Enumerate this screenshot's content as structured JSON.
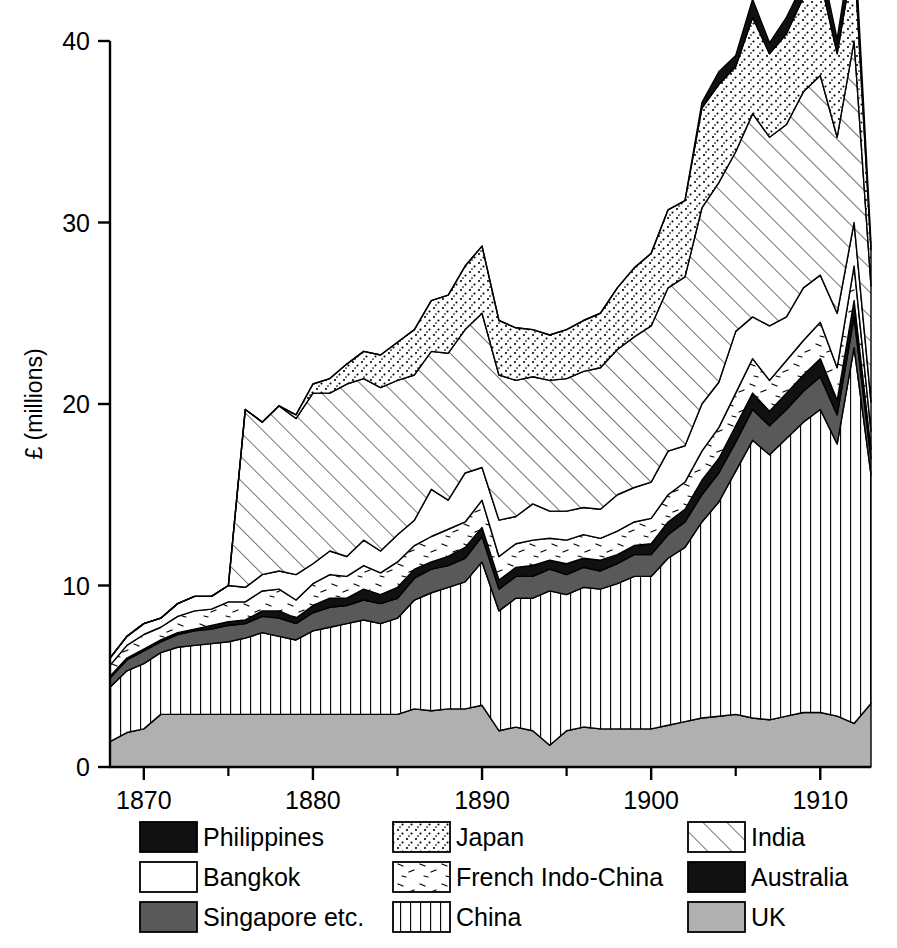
{
  "chart_data": {
    "type": "area",
    "stacked": true,
    "title": "",
    "xlabel": "",
    "ylabel": "£ (millions)",
    "xlim": [
      1868,
      1913
    ],
    "ylim": [
      0,
      40
    ],
    "yticks": [
      0,
      10,
      20,
      30,
      40
    ],
    "xticks": [
      1870,
      1880,
      1890,
      1900,
      1910
    ],
    "xminorticks": [
      1875,
      1885,
      1895,
      1905
    ],
    "grid": false,
    "legend_position": "below",
    "x": [
      1868,
      1869,
      1870,
      1871,
      1872,
      1873,
      1874,
      1875,
      1876,
      1877,
      1878,
      1879,
      1880,
      1881,
      1882,
      1883,
      1884,
      1885,
      1886,
      1887,
      1888,
      1889,
      1890,
      1891,
      1892,
      1893,
      1894,
      1895,
      1896,
      1897,
      1898,
      1899,
      1900,
      1901,
      1902,
      1903,
      1904,
      1905,
      1906,
      1907,
      1908,
      1909,
      1910,
      1911,
      1912,
      1913
    ],
    "stack_order_bottom_to_top": [
      "UK",
      "China",
      "Singapore etc.",
      "Philippines",
      "French Indo-China",
      "Bangkok",
      "India",
      "Japan",
      "Australia"
    ],
    "series": [
      {
        "name": "UK",
        "pattern": "solid-light-gray",
        "color": "#b0b0b0",
        "values": [
          1.4,
          1.9,
          2.1,
          2.9,
          2.9,
          2.9,
          2.9,
          2.9,
          2.9,
          2.9,
          2.9,
          2.9,
          2.9,
          2.9,
          2.9,
          2.9,
          2.9,
          2.9,
          3.2,
          3.1,
          3.2,
          3.2,
          3.4,
          2.0,
          2.2,
          2.0,
          1.2,
          2.0,
          2.2,
          2.1,
          2.1,
          2.1,
          2.1,
          2.3,
          2.5,
          2.7,
          2.8,
          2.9,
          2.7,
          2.6,
          2.8,
          3.0,
          3.0,
          2.8,
          2.4,
          3.5
        ]
      },
      {
        "name": "China",
        "pattern": "vertical-lines",
        "color": "#ffffff",
        "values": [
          3.0,
          3.4,
          3.6,
          3.4,
          3.7,
          3.8,
          3.9,
          4.0,
          4.2,
          4.5,
          4.3,
          4.1,
          4.6,
          4.8,
          5.0,
          5.2,
          5.0,
          5.3,
          6.0,
          6.5,
          6.7,
          7.0,
          7.9,
          6.6,
          7.1,
          7.3,
          8.5,
          7.5,
          7.7,
          7.7,
          8.0,
          8.4,
          8.4,
          9.2,
          9.6,
          10.8,
          11.8,
          13.4,
          15.3,
          14.6,
          15.3,
          16.0,
          16.7,
          15.0,
          20.7,
          12.6
        ]
      },
      {
        "name": "Singapore etc.",
        "pattern": "solid-dark-gray",
        "color": "#595959",
        "values": [
          0.5,
          0.6,
          0.7,
          0.6,
          0.7,
          0.8,
          0.8,
          0.9,
          0.8,
          0.9,
          1.0,
          0.9,
          1.0,
          1.1,
          1.0,
          1.1,
          1.1,
          1.1,
          1.2,
          1.3,
          1.2,
          1.3,
          1.4,
          1.2,
          1.2,
          1.2,
          1.2,
          1.1,
          1.1,
          1.0,
          1.1,
          1.2,
          1.2,
          1.3,
          1.4,
          1.5,
          1.6,
          1.6,
          1.7,
          1.6,
          1.6,
          1.7,
          1.8,
          1.6,
          1.7,
          0.9
        ]
      },
      {
        "name": "Philippines",
        "pattern": "solid-black",
        "color": "#111111",
        "values": [
          0.1,
          0.1,
          0.1,
          0.1,
          0.1,
          0.1,
          0.2,
          0.2,
          0.2,
          0.3,
          0.4,
          0.3,
          0.4,
          0.5,
          0.4,
          0.6,
          0.5,
          0.6,
          0.5,
          0.4,
          0.5,
          0.6,
          0.5,
          0.5,
          0.5,
          0.6,
          0.5,
          0.6,
          0.5,
          0.6,
          0.5,
          0.5,
          0.6,
          0.7,
          0.7,
          0.8,
          0.8,
          0.9,
          0.9,
          0.8,
          0.9,
          0.9,
          1.0,
          0.8,
          0.9,
          0.5
        ]
      },
      {
        "name": "French Indo-China",
        "pattern": "sparse-dashes",
        "color": "#ffffff",
        "values": [
          0.6,
          0.7,
          0.8,
          0.7,
          0.9,
          1.0,
          0.9,
          1.1,
          1.0,
          1.1,
          1.2,
          1.0,
          1.2,
          1.3,
          1.2,
          1.3,
          1.2,
          1.4,
          1.3,
          1.4,
          1.5,
          1.4,
          1.5,
          1.3,
          1.3,
          1.4,
          1.2,
          1.3,
          1.3,
          1.2,
          1.3,
          1.3,
          1.4,
          1.5,
          1.5,
          1.6,
          1.7,
          1.8,
          1.9,
          1.7,
          1.8,
          1.9,
          2.0,
          1.8,
          1.9,
          1.0
        ]
      },
      {
        "name": "Bangkok",
        "pattern": "white",
        "color": "#ffffff",
        "values": [
          0.4,
          0.5,
          0.6,
          0.5,
          0.7,
          0.8,
          0.7,
          0.9,
          0.8,
          0.9,
          1.0,
          1.4,
          1.1,
          1.3,
          1.1,
          1.4,
          1.2,
          1.5,
          1.4,
          2.6,
          1.6,
          2.7,
          1.8,
          2.0,
          1.5,
          2.0,
          1.5,
          1.6,
          1.5,
          1.6,
          2.0,
          1.9,
          2.0,
          2.4,
          2.0,
          2.6,
          2.5,
          3.4,
          2.3,
          3.0,
          2.4,
          2.9,
          2.6,
          3.0,
          2.4,
          1.6
        ]
      },
      {
        "name": "India",
        "pattern": "diagonal-hatch",
        "color": "#ffffff",
        "values": [
          0,
          0,
          0,
          0,
          0,
          0,
          0,
          0,
          9.8,
          8.4,
          9.1,
          8.6,
          9.4,
          8.7,
          9.5,
          8.9,
          9.0,
          8.5,
          8.0,
          7.6,
          8.1,
          7.9,
          8.5,
          8.0,
          7.5,
          7.0,
          7.2,
          7.3,
          7.5,
          7.8,
          8.0,
          8.3,
          8.6,
          9.0,
          9.3,
          10.8,
          11.0,
          9.9,
          11.2,
          10.4,
          10.6,
          10.8,
          11.0,
          9.7,
          10.0,
          6.4
        ]
      },
      {
        "name": "Japan",
        "pattern": "dense-stipple",
        "color": "#ffffff",
        "values": [
          0,
          0,
          0,
          0,
          0,
          0,
          0,
          0,
          0,
          0,
          0,
          0.2,
          0.5,
          0.8,
          1.1,
          1.5,
          1.8,
          2.1,
          2.5,
          2.8,
          3.2,
          3.5,
          3.7,
          3.0,
          2.9,
          2.6,
          2.5,
          2.7,
          2.8,
          3.0,
          3.4,
          3.8,
          4.0,
          4.3,
          4.2,
          5.5,
          5.4,
          4.7,
          5.3,
          4.6,
          5.0,
          5.2,
          5.3,
          4.6,
          4.8,
          2.0
        ]
      },
      {
        "name": "Australia",
        "pattern": "solid-black",
        "color": "#111111",
        "values": [
          0,
          0,
          0,
          0,
          0,
          0,
          0,
          0,
          0,
          0,
          0,
          0,
          0,
          0,
          0,
          0,
          0,
          0,
          0,
          0,
          0,
          0,
          0,
          0,
          0,
          0,
          0,
          0,
          0,
          0,
          0,
          0,
          0,
          0,
          0,
          0.3,
          0.7,
          0.6,
          1.0,
          0.6,
          0.9,
          0.8,
          1.1,
          0.8,
          1.4,
          0.4
        ]
      }
    ]
  },
  "legend": {
    "columns": [
      [
        {
          "label": "Philippines",
          "pattern": "solid-black"
        },
        {
          "label": "Bangkok",
          "pattern": "white"
        },
        {
          "label": "Singapore etc.",
          "pattern": "solid-dark-gray"
        }
      ],
      [
        {
          "label": "Japan",
          "pattern": "dense-stipple"
        },
        {
          "label": "French Indo-China",
          "pattern": "sparse-dashes"
        },
        {
          "label": "China",
          "pattern": "vertical-lines"
        }
      ],
      [
        {
          "label": "India",
          "pattern": "diagonal-hatch"
        },
        {
          "label": "Australia",
          "pattern": "solid-black"
        },
        {
          "label": "UK",
          "pattern": "solid-light-gray"
        }
      ]
    ]
  },
  "axis": {
    "y_title": "£ (millions)",
    "y_tick_labels": [
      "0",
      "10",
      "20",
      "30",
      "40"
    ],
    "x_tick_labels": [
      "1870",
      "1880",
      "1890",
      "1900",
      "1910"
    ]
  }
}
